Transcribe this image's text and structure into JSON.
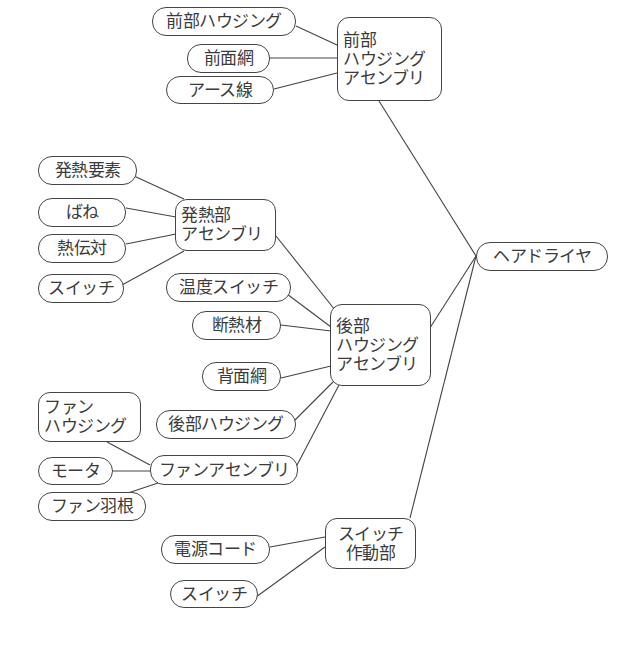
{
  "root": {
    "id": "hairdryer",
    "label": "ヘアドライヤ"
  },
  "nodes": {
    "front_assembly": {
      "label": "前部\nハウジング\nアセンブリ",
      "parent": "hairdryer"
    },
    "front_housing": {
      "label": "前部ハウジング",
      "parent": "front_assembly"
    },
    "front_mesh": {
      "label": "前面網",
      "parent": "front_assembly"
    },
    "ground_wire": {
      "label": "アース線",
      "parent": "front_assembly"
    },
    "rear_assembly": {
      "label": "後部\nハウジング\nアセンブリ",
      "parent": "hairdryer"
    },
    "heater_assembly": {
      "label": "発熱部\nアセンブリ",
      "parent": "rear_assembly"
    },
    "heating_element": {
      "label": "発熱要素",
      "parent": "heater_assembly"
    },
    "spring": {
      "label": "ばね",
      "parent": "heater_assembly"
    },
    "thermocouple": {
      "label": "熱伝対",
      "parent": "heater_assembly"
    },
    "heater_switch": {
      "label": "スイッチ",
      "parent": "heater_assembly"
    },
    "temp_switch": {
      "label": "温度スイッチ",
      "parent": "rear_assembly"
    },
    "insulation": {
      "label": "断熱材",
      "parent": "rear_assembly"
    },
    "rear_mesh": {
      "label": "背面網",
      "parent": "rear_assembly"
    },
    "rear_housing": {
      "label": "後部ハウジング",
      "parent": "rear_assembly"
    },
    "fan_assembly": {
      "label": "ファンアセンブリ",
      "parent": "rear_assembly"
    },
    "fan_housing": {
      "label": "ファン\nハウジング",
      "parent": "fan_assembly"
    },
    "motor": {
      "label": "モータ",
      "parent": "fan_assembly"
    },
    "fan_blade": {
      "label": "ファン羽根",
      "parent": "fan_assembly"
    },
    "switch_actuator": {
      "label": "スイッチ\n作動部",
      "parent": "hairdryer"
    },
    "power_cord": {
      "label": "電源コード",
      "parent": "switch_actuator"
    },
    "actuator_switch": {
      "label": "スイッチ",
      "parent": "switch_actuator"
    }
  }
}
